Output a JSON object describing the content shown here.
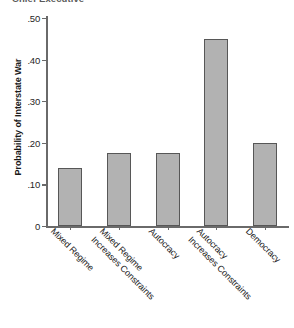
{
  "chart_data": {
    "type": "bar",
    "title": "Chief Executive",
    "xlabel": "",
    "ylabel": "Probability of Interstate War",
    "categories": [
      "Mixed Regime",
      "Mixed Regime Increases Constraints",
      "Autocracy",
      "Autocracy Increases Constraints",
      "Democracy"
    ],
    "category_lines": [
      [
        "Mixed Regime",
        ""
      ],
      [
        "Mixed Regime",
        "Increases Constraints"
      ],
      [
        "Autocracy",
        ""
      ],
      [
        "Autocracy",
        "Increases Constraints"
      ],
      [
        "Democracy",
        ""
      ]
    ],
    "values": [
      0.14,
      0.175,
      0.175,
      0.45,
      0.2
    ],
    "ylim": [
      0,
      0.5
    ],
    "ytick_values": [
      0.5,
      0.4,
      0.3,
      0.2,
      0.1,
      0
    ],
    "ytick_labels": [
      ".50",
      ".40",
      ".30",
      ".20",
      ".10",
      "0"
    ],
    "grid": false,
    "legend": false,
    "bar_color": "#b2b2b2",
    "bar_edge_color": "#575757",
    "axis_color": "#6a6a6a"
  }
}
